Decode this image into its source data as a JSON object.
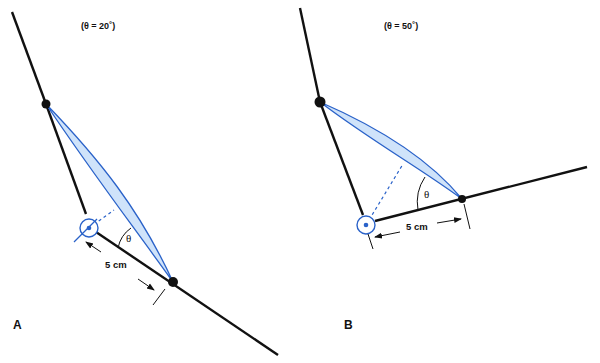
{
  "panels": [
    {
      "id": "A",
      "label": "A",
      "angle_caption": "(θ = 20˚)",
      "angle_symbol": "θ",
      "distance_label": "5 cm"
    },
    {
      "id": "B",
      "label": "B",
      "angle_caption": "(θ = 50˚)",
      "angle_symbol": "θ",
      "distance_label": "5 cm"
    }
  ],
  "colors": {
    "line": "#111111",
    "muscle_stroke": "#2a62c9",
    "muscle_fill": "#cfe3fa",
    "background": "#ffffff"
  }
}
